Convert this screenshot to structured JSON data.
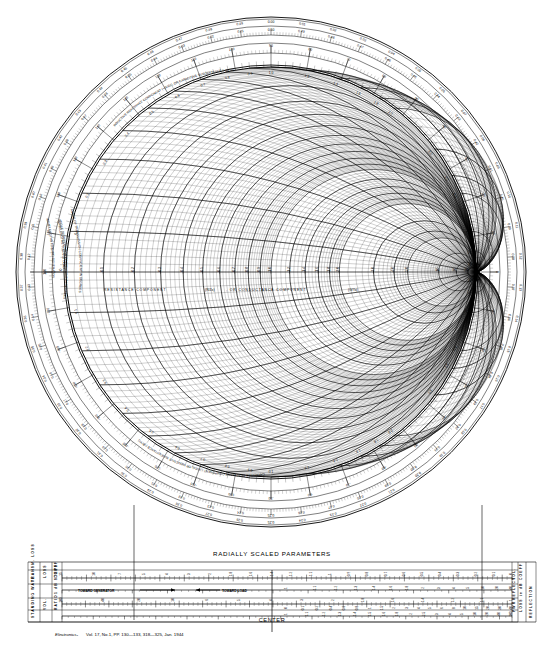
{
  "document": {
    "title": "Smith Chart",
    "subtitle": "Impedance or Admittance Coordinates",
    "footer_italic": "Electronics-",
    "footer_rest": "Vol. 17, No.1, PP. 130—133, 318—325, Jan. 1944"
  },
  "chart_data": {
    "type": "scatter",
    "xlabel": "RESISTANCE COMPONENT (R/Zo), OR CONDUCTANCE COMPONENT (G/Yo)",
    "ylabel": "",
    "grid": true,
    "legend_position": "none",
    "center": {
      "x": 271,
      "y": 272
    },
    "outer_radius": 255,
    "unit_circle_radius": 205,
    "resistance_circles": [
      0.1,
      0.2,
      0.3,
      0.4,
      0.5,
      0.6,
      0.7,
      0.8,
      0.9,
      1.0,
      1.2,
      1.4,
      1.6,
      1.8,
      2.0,
      3.0,
      4.0,
      5.0,
      10.0,
      20.0,
      50.0
    ],
    "reactance_arcs": [
      0.1,
      0.2,
      0.3,
      0.4,
      0.5,
      0.6,
      0.7,
      0.8,
      0.9,
      1.0,
      1.2,
      1.4,
      1.6,
      1.8,
      2.0,
      3.0,
      4.0,
      5.0,
      10.0,
      20.0,
      50.0
    ],
    "resistance_axis_labels": [
      "0.1",
      "0.2",
      "0.3",
      "0.4",
      "0.5",
      "0.6",
      "0.7",
      "0.8",
      "0.9",
      "1.0",
      "1.2",
      "1.4",
      "1.6",
      "1.8",
      "2.0",
      "3.0",
      "4.0",
      "5.0",
      "10",
      "20",
      "50"
    ],
    "reactance_labels": [
      "0.1",
      "0.2",
      "0.3",
      "0.4",
      "0.5",
      "0.6",
      "0.7",
      "0.8",
      "0.9",
      "1.0",
      "1.2",
      "1.4",
      "1.6",
      "1.8",
      "2.0",
      "3.0",
      "4.0",
      "5.0",
      "10",
      "20",
      "50"
    ]
  },
  "chart_interior_labels": {
    "resistance_axis": "RESISTANCE COMPONENT",
    "resistance_axis_sym1": "(R/Zo)",
    "resistance_axis_mid": ", OR CONDUCTANCE COMPONENT",
    "resistance_axis_sym2": "(G/Yo)",
    "inductive": "INDUCTIVE REACTANCE COMPONENT (+jX/Zo), OR CAPACITIVE SUSCEPTANCE (+jB/Yo)",
    "capacitive": "CAPACITIVE REACTANCE COMPONENT (-jX/Zo), OR INDUCTIVE SUSCEPTANCE (-jB/Yo)"
  },
  "outer_rings": {
    "ring1_label": "WAVELENGTHS TOWARD GENERATOR",
    "ring2_label": "WAVELENGTHS TOWARD LOAD",
    "ring3_label": "ANGLE OF REFLECTION COEFFICIENT IN DEGREES",
    "ring4_label": "ANGLE OF TRANSMISSION COEFFICIENT IN DEGREES",
    "wavelength_gen": [
      "0.00",
      "0.01",
      "0.02",
      "0.03",
      "0.04",
      "0.05",
      "0.06",
      "0.07",
      "0.08",
      "0.09",
      "0.10",
      "0.11",
      "0.12",
      "0.13",
      "0.14",
      "0.15",
      "0.16",
      "0.17",
      "0.18",
      "0.19",
      "0.20",
      "0.21",
      "0.22",
      "0.23",
      "0.24",
      "0.25",
      "0.26",
      "0.27",
      "0.28",
      "0.29",
      "0.30",
      "0.31",
      "0.32",
      "0.33",
      "0.34",
      "0.35",
      "0.36",
      "0.37",
      "0.38",
      "0.39",
      "0.40",
      "0.41",
      "0.42",
      "0.43",
      "0.44",
      "0.45",
      "0.46",
      "0.47",
      "0.48",
      "0.49"
    ],
    "wavelength_load": [
      "0.50",
      "0.49",
      "0.48",
      "0.47",
      "0.46",
      "0.45",
      "0.44",
      "0.43",
      "0.42",
      "0.41",
      "0.40",
      "0.39",
      "0.38",
      "0.37",
      "0.36",
      "0.35",
      "0.34",
      "0.33",
      "0.32",
      "0.31",
      "0.30",
      "0.29",
      "0.28",
      "0.27",
      "0.26",
      "0.25",
      "0.24",
      "0.23",
      "0.22",
      "0.21",
      "0.20",
      "0.19",
      "0.18",
      "0.17",
      "0.16",
      "0.15",
      "0.14",
      "0.13",
      "0.12",
      "0.11",
      "0.10",
      "0.09",
      "0.08",
      "0.07",
      "0.06",
      "0.05",
      "0.04",
      "0.03",
      "0.02",
      "0.01"
    ],
    "angle_degrees": [
      "0",
      "10",
      "20",
      "30",
      "40",
      "50",
      "60",
      "70",
      "80",
      "90",
      "100",
      "110",
      "120",
      "130",
      "140",
      "150",
      "160",
      "170",
      "180",
      "-170",
      "-160",
      "-150",
      "-140",
      "-130",
      "-120",
      "-110",
      "-100",
      "-90",
      "-80",
      "-70",
      "-60",
      "-50",
      "-40",
      "-30",
      "-20",
      "-10"
    ]
  },
  "radially_scaled": {
    "title": "RADIALLY SCALED PARAMETERS",
    "center_label": "CENTER",
    "toward_generator": "TOWARD GENERATOR",
    "toward_load": "TOWARD LOAD",
    "left_labels": [
      {
        "l1": "TRANSM. LOSS",
        "l2": "1 dB STEPS"
      },
      {
        "l1": "LOSS",
        "l2": "COEFF"
      },
      {
        "l1": "STANDING WAVE",
        "l2": "dB"
      },
      {
        "l1": "VOL.",
        "l2": "RATIO"
      }
    ],
    "left_group_a_top": "TRANSM. LOSS",
    "left_group_a_bot": "1 dB STEPS",
    "left_group_b_top": "LOSS",
    "left_group_b_bot": "COEFF",
    "left_group_c_top": "STANDING WAVE",
    "left_group_c_bot": "dB",
    "left_group_d_top": "VOL.",
    "left_group_d_bot": "RATIO",
    "right_vertical": "REFLECTION",
    "right_labels": [
      {
        "l1": "VOL.",
        "l2": "COEFF"
      },
      {
        "l1": "PWR",
        "l2": "LOSS in dB"
      },
      {
        "l1": "REFLECT",
        "l2": "ATTENUAT."
      }
    ],
    "scale1_numbers": [
      "15",
      "10",
      "7",
      "5",
      "4",
      "3",
      "2",
      "1.8",
      "1.6",
      "1.4",
      "1.2",
      "1.1",
      "1",
      "0.9",
      "0.8",
      "0.7",
      "0.6",
      "0.5",
      "0.4",
      "0.3",
      "0.2",
      "0.1",
      "0"
    ],
    "scale2_numbers": [
      "1",
      "1.1",
      "1.2",
      "1.3",
      "1.4",
      "1.6",
      "1.8",
      "2",
      "3",
      "4",
      "5",
      "10",
      "20",
      "40"
    ],
    "scale3_numbers": [
      "100",
      "40",
      "20",
      "10",
      "6",
      "5",
      "4",
      "3",
      "2",
      "1.8",
      "1.6",
      "1.4",
      "1.2",
      "1.1",
      "1"
    ],
    "scale4_numbers": [
      "1",
      "1.1",
      "1.2",
      "1.3",
      "1.4",
      "1.5",
      "1.6",
      "1.8",
      "2",
      "2.5",
      "3",
      "4",
      "5",
      "10",
      "20",
      "40",
      "100"
    ],
    "dB_numbers": [
      "0",
      "0.1",
      "0.2",
      "0.4",
      "0.6",
      "0.8",
      "1",
      "1.5",
      "2",
      "3",
      "4",
      "5",
      "6",
      "8",
      "10",
      "15",
      "20",
      "30",
      "40"
    ]
  }
}
